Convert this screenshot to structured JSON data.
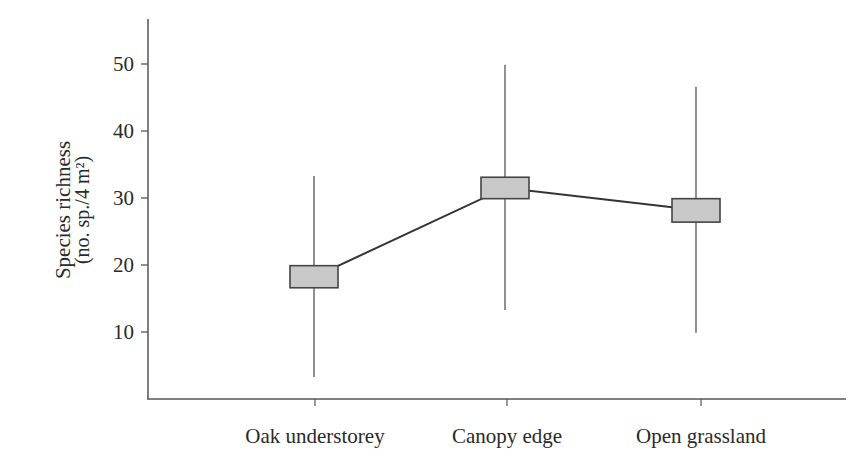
{
  "chart_data": {
    "type": "line",
    "subtype": "mean-with-range-and-box",
    "title": "",
    "xlabel": "",
    "ylabel": "Species richness",
    "ylabel_units": "(no. sp./4 m²)",
    "categories": [
      "Oak understorey",
      "Canopy edge",
      "Open grassland"
    ],
    "series": [
      {
        "name": "Species richness",
        "mean": [
          18.2,
          31.5,
          28.2
        ],
        "box_low": [
          16.6,
          29.9,
          26.4
        ],
        "box_high": [
          19.9,
          33.1,
          29.9
        ],
        "min": [
          3.3,
          13.3,
          9.9
        ],
        "max": [
          33.3,
          49.9,
          46.6
        ]
      }
    ],
    "yticks": [
      10,
      20,
      30,
      40,
      50
    ],
    "ytick_labels": [
      "10",
      "20",
      "30",
      "40",
      "50"
    ],
    "ylim": [
      0,
      56
    ],
    "grid": false,
    "legend": null,
    "colors": {
      "box_fill": "#c8c8c8",
      "box_stroke": "#444444",
      "line": "#333333",
      "whisker": "#555555",
      "axis": "#555555",
      "text": "#2a2a2a"
    }
  }
}
